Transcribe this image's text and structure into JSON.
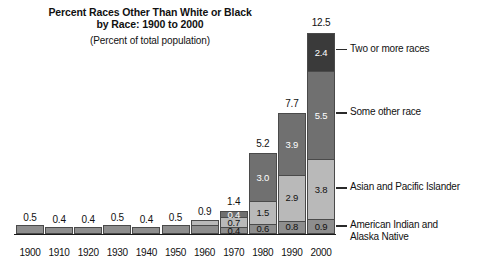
{
  "title": {
    "line1": "Percent Races Other Than White or Black",
    "line2": "by Race: 1900 to 2000",
    "subtitle": "(Percent of total population)"
  },
  "chart_data": {
    "type": "bar",
    "stacked": true,
    "title": "Percent Races Other Than White or Black by Race: 1900 to 2000",
    "subtitle": "(Percent of total population)",
    "xlabel": "",
    "ylabel": "",
    "ylim": [
      0,
      12.5
    ],
    "grid": false,
    "legend_position": "right-callout",
    "categories": [
      "1900",
      "1910",
      "1920",
      "1930",
      "1940",
      "1950",
      "1960",
      "1970",
      "1980",
      "1990",
      "2000"
    ],
    "totals": [
      "0.5",
      "0.4",
      "0.4",
      "0.5",
      "0.4",
      "0.5",
      "0.9",
      "1.4",
      "5.2",
      "7.7",
      "12.5"
    ],
    "totals_numeric": [
      0.5,
      0.4,
      0.4,
      0.5,
      0.4,
      0.5,
      0.9,
      1.4,
      5.2,
      7.7,
      12.5
    ],
    "series": [
      {
        "name": "American Indian and Alaska Native",
        "color": "#8e8e8e",
        "label_color": "dark",
        "values": [
          0.5,
          0.4,
          0.4,
          0.5,
          0.4,
          0.5,
          0.5,
          0.4,
          0.6,
          0.8,
          0.9
        ],
        "labels": [
          "",
          "",
          "",
          "",
          "",
          "",
          "",
          "0.4",
          "0.6",
          "0.8",
          "0.9"
        ]
      },
      {
        "name": "Asian and Pacific Islander",
        "color": "#b9b9b9",
        "label_color": "dark",
        "values": [
          0,
          0,
          0,
          0,
          0,
          0,
          0.4,
          0.7,
          1.5,
          2.9,
          3.8
        ],
        "labels": [
          "",
          "",
          "",
          "",
          "",
          "",
          "",
          "0.7",
          "1.5",
          "2.9",
          "3.8"
        ]
      },
      {
        "name": "Some other race",
        "color": "#707070",
        "label_color": "light",
        "values": [
          0,
          0,
          0,
          0,
          0,
          0,
          0,
          0.4,
          3.0,
          3.9,
          5.5
        ],
        "labels": [
          "",
          "",
          "",
          "",
          "",
          "",
          "",
          "0.4",
          "3.0",
          "3.9",
          "5.5"
        ]
      },
      {
        "name": "Two or more races",
        "color": "#3a3a3a",
        "label_color": "light",
        "values": [
          0,
          0,
          0,
          0,
          0,
          0,
          0,
          0,
          0,
          0,
          2.4
        ],
        "labels": [
          "",
          "",
          "",
          "",
          "",
          "",
          "",
          "",
          "",
          "",
          "2.4"
        ]
      }
    ]
  },
  "legend": [
    {
      "label": "Two or more races",
      "label_line1": "Two or more races",
      "label_line2": ""
    },
    {
      "label": "Some other race",
      "label_line1": "Some other race",
      "label_line2": ""
    },
    {
      "label": "Asian and Pacific Islander",
      "label_line1": "Asian and Pacific Islander",
      "label_line2": ""
    },
    {
      "label": "American Indian and Alaska Native",
      "label_line1": "American Indian and",
      "label_line2": "Alaska Native"
    }
  ],
  "colors": {
    "two_or_more_races": "#3a3a3a",
    "some_other_race": "#707070",
    "asian_pacific_islander": "#b9b9b9",
    "american_indian_alaska_native": "#8e8e8e",
    "axis": "#1a1a1a",
    "background": "#ffffff"
  }
}
